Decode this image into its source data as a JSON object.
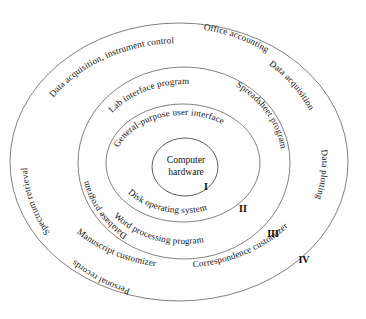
{
  "diagram": {
    "type": "concentric-layers",
    "center": {
      "line1": "Computer",
      "line2": "hardware",
      "numeral": "I"
    },
    "layers": [
      {
        "numeral": "I",
        "name": "Computer hardware",
        "labels": [
          "Computer",
          "hardware"
        ]
      },
      {
        "numeral": "II",
        "name": "Disk operating system",
        "labels": [
          "General-purpose user interface",
          "Disk operating system"
        ]
      },
      {
        "numeral": "III",
        "name": "Application programs",
        "labels": [
          "Lab interface program",
          "Database program",
          "Spreadsheet program",
          "Word processing program"
        ]
      },
      {
        "numeral": "IV",
        "name": "Customized applications",
        "labels": [
          "Data acquisition, instrument control",
          "Office accounting",
          "Data acquisition",
          "Data plotting",
          "Correspondence customizer",
          "Manuscript customizer",
          "Personal records",
          "Spectrum retrieval"
        ]
      }
    ],
    "ring_labels": {
      "outer_top": "Data acquisition, instrument control",
      "outer_right_upper": "Office accounting",
      "outer_right_mid": "Data acquisition",
      "outer_right_lower": "Data plotting",
      "outer_bottom_right": "Correspondence customizer",
      "outer_bottom_left": "Manuscript customizer",
      "outer_left_lower": "Personal records",
      "outer_left_upper": "Spectrum retrieval",
      "ring3_top": "Lab interface program",
      "ring3_left": "Database program",
      "ring3_right": "Spreadsheet program",
      "ring3_bottom": "Word processing program",
      "ring2_top": "General-purpose user interface",
      "ring2_bottom": "Disk operating system"
    },
    "numerals": {
      "one": "I",
      "two": "II",
      "three": "III",
      "four": "IV"
    },
    "colors": {
      "stroke": "#6d6a66",
      "text": "#15120f",
      "background": "#ffffff"
    }
  }
}
